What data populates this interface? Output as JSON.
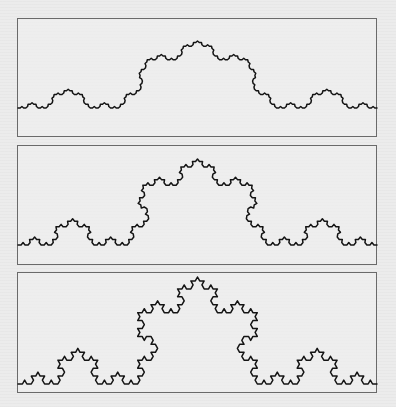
{
  "figure": {
    "panels": [
      {
        "id": "panel-1",
        "top": 18,
        "height": 119,
        "baseline": 89,
        "peak_height": 67,
        "angle_deg": 38,
        "levels": 4
      },
      {
        "id": "panel-2",
        "top": 145,
        "height": 120,
        "baseline": 99,
        "peak_height": 86,
        "angle_deg": 50,
        "levels": 4
      },
      {
        "id": "panel-3",
        "top": 272,
        "height": 121,
        "baseline": 111,
        "peak_height": 107,
        "angle_deg": 60,
        "levels": 4
      }
    ],
    "stroke_color": "#141414",
    "frame_color": "#6a6a6a"
  }
}
